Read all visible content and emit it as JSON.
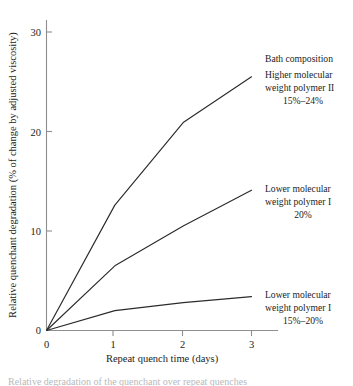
{
  "figure": {
    "background": "#ffffff",
    "curve_color": "#2b2b2b",
    "axis_color": "#8e8e8e",
    "caption_partial": "Relative degradation of the quenchant over repeat quenches"
  },
  "axes": {
    "x_title": "Repeat quench time (days)",
    "y_title": "Relative quenchant degradation (% of change by adjusted viscosity)",
    "x_ticks": [
      "0",
      "1",
      "2",
      "3"
    ],
    "y_ticks": [
      "0",
      "10",
      "20",
      "30"
    ]
  },
  "annotations": {
    "series_top": {
      "line1": "Bath composition",
      "line2": "Higher molecular",
      "line3": "weight polymer II",
      "line4": "15%–24%"
    },
    "series_middle": {
      "line1": "Lower molecular",
      "line2": "weight polymer I",
      "line3": "20%"
    },
    "series_bottom": {
      "line1": "Lower molecular",
      "line2": "weight polymer I",
      "line3": "15%–20%"
    }
  },
  "chart_data": {
    "type": "line",
    "title": "",
    "xlabel": "Repeat quench time (days)",
    "ylabel": "Relative quenchant degradation (% of change by adjusted viscosity)",
    "x": [
      0,
      1,
      2,
      3
    ],
    "xlim": [
      0,
      3.45
    ],
    "ylim": [
      0,
      32
    ],
    "xticks": [
      0,
      1,
      2,
      3
    ],
    "yticks": [
      0,
      10,
      20,
      30
    ],
    "grid": false,
    "legend": "inline-annotations-right",
    "series": [
      {
        "name": "Higher molecular weight polymer II 15%–24%",
        "values": [
          0,
          12.6,
          20.9,
          25.5
        ]
      },
      {
        "name": "Lower molecular weight polymer I 20%",
        "values": [
          0,
          6.5,
          10.5,
          14.1
        ]
      },
      {
        "name": "Lower molecular weight polymer I 15%–20%",
        "values": [
          0,
          2.0,
          2.8,
          3.4
        ]
      }
    ]
  }
}
